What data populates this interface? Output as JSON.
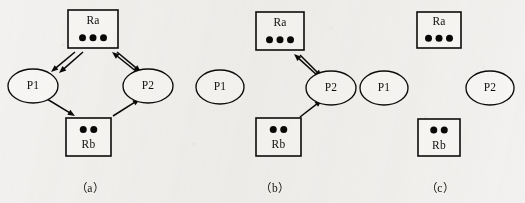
{
  "figure": {
    "background_color": "#f2f1ef",
    "ink_color": "#0b0a09"
  },
  "node_types": {
    "resource": "rectangle-with-unit-dots",
    "process": "ellipse"
  },
  "nodes": {
    "Ra": {
      "label": "Ra",
      "type": "resource",
      "units": 3,
      "label_position": "top"
    },
    "Rb": {
      "label": "Rb",
      "type": "resource",
      "units": 2,
      "label_position": "bottom"
    },
    "P1": {
      "label": "P1",
      "type": "process"
    },
    "P2": {
      "label": "P2",
      "type": "process"
    }
  },
  "panels": [
    {
      "id": "a",
      "caption": "（a）",
      "nodes": [
        {
          "ref": "Ra",
          "label": "Ra",
          "type": "resource",
          "units": 3,
          "label_position": "top",
          "x": 68,
          "y": 10,
          "w": 50,
          "h": 38
        },
        {
          "ref": "P1",
          "label": "P1",
          "type": "process",
          "cx": 33,
          "cy": 86,
          "rx": 25,
          "ry": 17
        },
        {
          "ref": "P2",
          "label": "P2",
          "type": "process",
          "cx": 148,
          "cy": 86,
          "rx": 25,
          "ry": 17
        },
        {
          "ref": "Rb",
          "label": "Rb",
          "type": "resource",
          "units": 2,
          "label_position": "bottom",
          "x": 66,
          "y": 118,
          "w": 45,
          "h": 38
        }
      ],
      "edges": [
        {
          "from": "Ra",
          "to": "P1",
          "kind": "assignment",
          "style": "double-parallel",
          "x1": 75,
          "y1": 52,
          "x2": 51,
          "y2": 72
        },
        {
          "from": "Ra",
          "to": "P1",
          "kind": "assignment",
          "style": "double-parallel",
          "x1": 83,
          "y1": 52,
          "x2": 59,
          "y2": 73
        },
        {
          "from": "P2",
          "to": "Ra",
          "kind": "request",
          "style": "single",
          "x1": 137,
          "y1": 72,
          "x2": 112,
          "y2": 52
        },
        {
          "from": "Ra",
          "to": "P2",
          "kind": "assignment",
          "style": "single",
          "x1": 117,
          "y1": 52,
          "x2": 141,
          "y2": 72
        },
        {
          "from": "P1",
          "to": "Rb",
          "kind": "request",
          "style": "single",
          "x1": 47,
          "y1": 99,
          "x2": 75,
          "y2": 116
        },
        {
          "from": "Rb",
          "to": "P2",
          "kind": "assignment",
          "style": "single",
          "x1": 113,
          "y1": 116,
          "x2": 140,
          "y2": 99
        }
      ]
    },
    {
      "id": "b",
      "caption": "（b）",
      "nodes": [
        {
          "ref": "Ra",
          "label": "Ra",
          "type": "resource",
          "units": 3,
          "label_position": "top",
          "x": 66,
          "y": 12,
          "w": 48,
          "h": 38
        },
        {
          "ref": "P1",
          "label": "P1",
          "type": "process",
          "cx": 30,
          "cy": 87,
          "rx": 24,
          "ry": 17
        },
        {
          "ref": "P2",
          "label": "P2",
          "type": "process",
          "cx": 141,
          "cy": 88,
          "rx": 25,
          "ry": 17
        },
        {
          "ref": "Rb",
          "label": "Rb",
          "type": "resource",
          "units": 2,
          "label_position": "bottom",
          "x": 66,
          "y": 118,
          "w": 45,
          "h": 38
        }
      ],
      "edges": [
        {
          "from": "P2",
          "to": "Ra",
          "kind": "request",
          "style": "single",
          "x1": 128,
          "y1": 76,
          "x2": 104,
          "y2": 54
        },
        {
          "from": "Ra",
          "to": "P2",
          "kind": "assignment",
          "style": "single",
          "x1": 110,
          "y1": 55,
          "x2": 132,
          "y2": 77
        },
        {
          "from": "Rb",
          "to": "P2",
          "kind": "assignment",
          "style": "single",
          "x1": 110,
          "y1": 117,
          "x2": 132,
          "y2": 100
        }
      ]
    },
    {
      "id": "c",
      "caption": "（c）",
      "nodes": [
        {
          "ref": "Ra",
          "label": "Ra",
          "type": "resource",
          "units": 3,
          "label_position": "top",
          "x": 62,
          "y": 12,
          "w": 44,
          "h": 36
        },
        {
          "ref": "P1",
          "label": "P1",
          "type": "process",
          "cx": 29,
          "cy": 88,
          "rx": 24,
          "ry": 17
        },
        {
          "ref": "P2",
          "label": "P2",
          "type": "process",
          "cx": 135,
          "cy": 88,
          "rx": 24,
          "ry": 17
        },
        {
          "ref": "Rb",
          "label": "Rb",
          "type": "resource",
          "units": 2,
          "label_position": "bottom",
          "x": 63,
          "y": 119,
          "w": 42,
          "h": 37
        }
      ],
      "edges": []
    }
  ],
  "panel_offsets": [
    {
      "id": "a",
      "left": 0,
      "width": 180
    },
    {
      "id": "b",
      "left": 190,
      "width": 170
    },
    {
      "id": "c",
      "left": 355,
      "width": 170
    }
  ]
}
